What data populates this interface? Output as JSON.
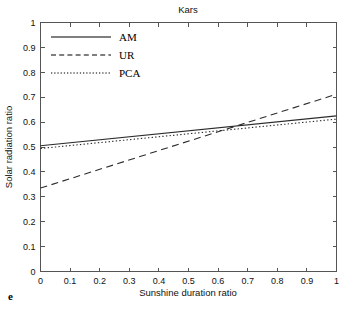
{
  "figure": {
    "panel_label": "e",
    "title": "Kars"
  },
  "chart_data": {
    "type": "line",
    "title": "Kars",
    "xlabel": "Sunshine duration ratio",
    "ylabel": "Solar radiation ratio",
    "xlim": [
      0,
      1
    ],
    "ylim": [
      0,
      1
    ],
    "xticks": [
      0,
      0.1,
      0.2,
      0.3,
      0.4,
      0.5,
      0.6,
      0.7,
      0.8,
      0.9,
      1
    ],
    "yticks": [
      0,
      0.1,
      0.2,
      0.3,
      0.4,
      0.5,
      0.6,
      0.7,
      0.8,
      0.9,
      1
    ],
    "xtick_labels": [
      "0",
      "0.1",
      "0.2",
      "0.3",
      "0.4",
      "0.5",
      "0.6",
      "0.7",
      "0.8",
      "0.9",
      "1"
    ],
    "ytick_labels": [
      "0",
      "0.1",
      "0.2",
      "0.3",
      "0.4",
      "0.5",
      "0.6",
      "0.7",
      "0.8",
      "0.9",
      "1"
    ],
    "grid": false,
    "legend_position": "upper left",
    "series": [
      {
        "name": "AM",
        "style": "solid",
        "x": [
          0,
          1
        ],
        "values": [
          0.505,
          0.625
        ]
      },
      {
        "name": "UR",
        "style": "dashed",
        "x": [
          0,
          1
        ],
        "values": [
          0.335,
          0.712
        ]
      },
      {
        "name": "PCA",
        "style": "dotted",
        "x": [
          0,
          1
        ],
        "values": [
          0.494,
          0.612
        ]
      }
    ]
  },
  "legend": {
    "items": [
      {
        "label": "AM",
        "style": "solid"
      },
      {
        "label": "UR",
        "style": "dashed"
      },
      {
        "label": "PCA",
        "style": "dotted"
      }
    ]
  }
}
